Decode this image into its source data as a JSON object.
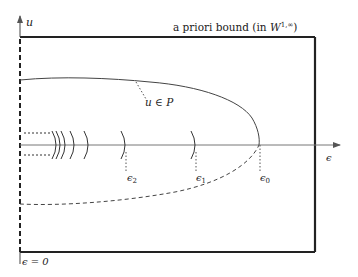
{
  "diagram": {
    "labels": {
      "y_axis": "u",
      "x_axis": "ϵ",
      "bound_prefix": "a priori bound (in ",
      "bound_W": "W",
      "bound_sup": "1,∞",
      "bound_suffix": ")",
      "branch": "u ∈ P",
      "eps0": "ϵ",
      "eps0_sub": "0",
      "eps1": "ϵ",
      "eps1_sub": "1",
      "eps2": "ϵ",
      "eps2_sub": "2",
      "origin": "ϵ = 0"
    },
    "colors": {
      "frame": "#222222",
      "curve": "#444444",
      "axis": "#666666"
    },
    "markers": [
      {
        "name": "epsilon-0",
        "x": 259
      },
      {
        "name": "epsilon-1",
        "x": 195
      },
      {
        "name": "epsilon-2",
        "x": 125
      }
    ]
  }
}
